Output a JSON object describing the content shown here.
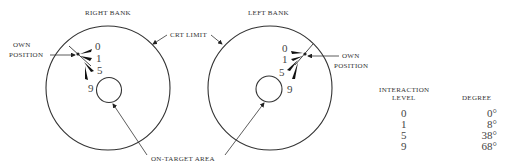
{
  "diagrams": {
    "right_bank": {
      "title": "RIGHT BANK",
      "own_position_label_1": "OWN",
      "own_position_label_2": "POSITION",
      "levels": [
        "0",
        "1",
        "5",
        "9"
      ]
    },
    "left_bank": {
      "title": "LEFT BANK",
      "own_position_label_1": "OWN",
      "own_position_label_2": "POSITION",
      "levels": [
        "0",
        "1",
        "5",
        "9"
      ]
    },
    "crt_limit_label": "CRT LIMIT",
    "on_target_label": "ON-TARGET AREA"
  },
  "table": {
    "header_level_1": "INTERACTION",
    "header_level_2": "LEVEL",
    "header_degree": "DEGREE",
    "rows": [
      {
        "level": "0",
        "degree": "0°"
      },
      {
        "level": "1",
        "degree": "8°"
      },
      {
        "level": "5",
        "degree": "38°"
      },
      {
        "level": "9",
        "degree": "68°"
      }
    ]
  }
}
